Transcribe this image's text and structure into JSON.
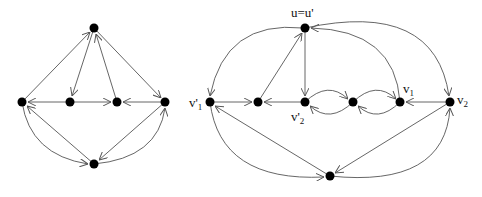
{
  "colors": {
    "edge": "#555555",
    "node": "#000000",
    "background": "#ffffff"
  },
  "left_graph": {
    "nodes": [
      {
        "id": "top",
        "x": 94,
        "y": 28
      },
      {
        "id": "L",
        "x": 22,
        "y": 102
      },
      {
        "id": "M1",
        "x": 70,
        "y": 102
      },
      {
        "id": "M2",
        "x": 117,
        "y": 102
      },
      {
        "id": "R",
        "x": 165,
        "y": 102
      },
      {
        "id": "B",
        "x": 94,
        "y": 164
      }
    ],
    "edges": [
      {
        "from": "L",
        "to": "top",
        "type": "line"
      },
      {
        "from": "top",
        "to": "M1",
        "type": "line"
      },
      {
        "from": "M2",
        "to": "top",
        "type": "line"
      },
      {
        "from": "top",
        "to": "R",
        "type": "line"
      },
      {
        "from": "M1",
        "to": "L",
        "type": "line"
      },
      {
        "from": "M1",
        "to": "M2",
        "type": "line"
      },
      {
        "from": "R",
        "to": "M2",
        "type": "line"
      },
      {
        "from": "B",
        "to": "L",
        "type": "line"
      },
      {
        "from": "L",
        "to": "B",
        "type": "curve"
      },
      {
        "from": "R",
        "to": "B",
        "type": "line"
      },
      {
        "from": "B",
        "to": "R",
        "type": "curve"
      }
    ]
  },
  "right_graph": {
    "nodes": [
      {
        "id": "u",
        "x": 305,
        "y": 28,
        "label": "u=u'"
      },
      {
        "id": "v1p",
        "x": 210,
        "y": 102,
        "label": "v'",
        "sub": "1"
      },
      {
        "id": "mid",
        "x": 258,
        "y": 102
      },
      {
        "id": "v2p",
        "x": 305,
        "y": 102,
        "label": "v'",
        "sub": "2"
      },
      {
        "id": "c",
        "x": 353,
        "y": 102
      },
      {
        "id": "v1",
        "x": 400,
        "y": 102,
        "label": "v",
        "sub": "1"
      },
      {
        "id": "v2",
        "x": 450,
        "y": 102,
        "label": "v",
        "sub": "2"
      },
      {
        "id": "bot",
        "x": 330,
        "y": 176
      }
    ],
    "edges": [
      {
        "from": "u",
        "to": "v1p",
        "type": "arc"
      },
      {
        "from": "mid",
        "to": "u",
        "type": "line"
      },
      {
        "from": "u",
        "to": "v2p",
        "type": "line"
      },
      {
        "from": "v1p",
        "to": "mid",
        "type": "line"
      },
      {
        "from": "v2p",
        "to": "mid",
        "type": "line"
      },
      {
        "from": "v2p",
        "to": "c",
        "type": "upper-arc"
      },
      {
        "from": "c",
        "to": "v2p",
        "type": "lower-arc"
      },
      {
        "from": "c",
        "to": "v1",
        "type": "upper-arc"
      },
      {
        "from": "v1",
        "to": "c",
        "type": "lower-arc"
      },
      {
        "from": "v2",
        "to": "v1",
        "type": "line"
      },
      {
        "from": "v1",
        "to": "u",
        "type": "arc"
      },
      {
        "from": "u",
        "to": "v2",
        "type": "arc"
      },
      {
        "from": "v2",
        "to": "bot",
        "type": "line"
      },
      {
        "from": "bot",
        "to": "v1p",
        "type": "line"
      },
      {
        "from": "v1p",
        "to": "bot",
        "type": "curve"
      },
      {
        "from": "bot",
        "to": "v2",
        "type": "curve"
      }
    ]
  },
  "labels": {
    "u": "u=u'",
    "v1p": "v'",
    "v1p_sub": "1",
    "v2p": "v'",
    "v2p_sub": "2",
    "v1": "v",
    "v1_sub": "1",
    "v2": "v",
    "v2_sub": "2"
  }
}
